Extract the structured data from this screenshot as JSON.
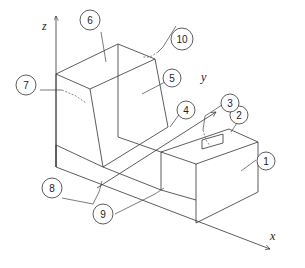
{
  "diagram": {
    "type": "isometric-part-drawing",
    "axes": {
      "x_label": "x",
      "y_label": "y",
      "z_label": "z"
    },
    "callouts": [
      {
        "id": "1",
        "label": "1"
      },
      {
        "id": "2",
        "label": "2"
      },
      {
        "id": "3",
        "label": "3"
      },
      {
        "id": "4",
        "label": "4"
      },
      {
        "id": "5",
        "label": "5"
      },
      {
        "id": "6",
        "label": "6"
      },
      {
        "id": "7",
        "label": "7"
      },
      {
        "id": "8",
        "label": "8"
      },
      {
        "id": "9",
        "label": "9"
      },
      {
        "id": "10",
        "label": "10"
      }
    ],
    "colors": {
      "line": "#333333",
      "background": "#ffffff"
    }
  }
}
